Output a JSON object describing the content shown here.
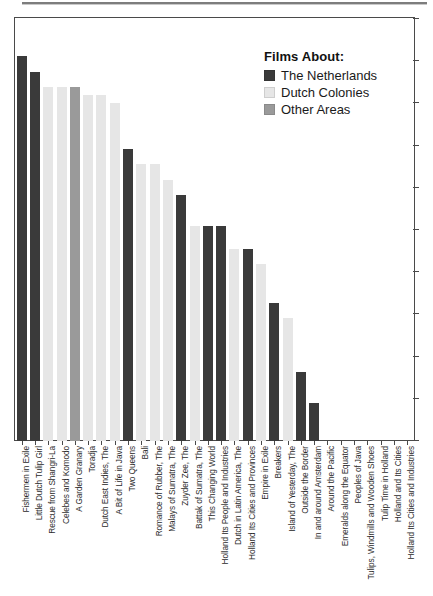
{
  "chart_data": {
    "type": "bar",
    "title": "",
    "subtitle": "",
    "xlabel": "",
    "ylabel": "",
    "grid": false,
    "legend_position": "top-right",
    "legend_title": "Films About:",
    "axis": {
      "y_tick_count": 11,
      "y_tick_labels": [],
      "x_tick_count": 27,
      "ylim": [
        0,
        11
      ]
    },
    "groups": [
      {
        "name": "The Netherlands",
        "color": "#3a3a3a"
      },
      {
        "name": "Dutch Colonies",
        "color": "#e6e6e6"
      },
      {
        "name": "Other Areas",
        "color": "#9a9a9a"
      }
    ],
    "categories": [
      "Fishermen in Exile",
      "Little Dutch Tulip Girl",
      "Rescue from Shangri-La",
      "Celebes and Komodo",
      "A Garden Granary",
      "Toradja",
      "Dutch East Indies, The",
      "A Bit of Life in Java",
      "Two Queens",
      "Bali",
      "Romance of Rubber, The",
      "Malays of Sumatra, The",
      "Zuyder Zee, The",
      "Battak of Sumatra, The",
      "This Changing World",
      "Holland  Its People and Industries",
      "Dutch in Latin America, The",
      "Holland  Its Cities and Provinces",
      "Empire in Exile",
      "Breakers",
      "Island of Yesterday, The",
      "Outside the Border",
      "In and around Amsterdam",
      "Around the Pacific",
      "Emeralds along the Equator",
      "Peoples of Java",
      "Tulips, Windmills and Wooden Shoes",
      "Tulip Time in Holland",
      "Holland and Its Cities",
      "Holland  Its Cities and Industries"
    ],
    "values": [
      10.0,
      9.6,
      9.2,
      9.2,
      9.2,
      9.0,
      9.0,
      8.8,
      7.6,
      7.2,
      7.2,
      6.8,
      6.4,
      5.6,
      5.6,
      5.6,
      5.0,
      5.0,
      4.6,
      3.6,
      3.2,
      1.8,
      1.0,
      0.0,
      0.0,
      0.0,
      0.0,
      0.0,
      0.0,
      0.0
    ],
    "series_groups": [
      "The Netherlands",
      "The Netherlands",
      "Dutch Colonies",
      "Dutch Colonies",
      "Other Areas",
      "Dutch Colonies",
      "Dutch Colonies",
      "Dutch Colonies",
      "The Netherlands",
      "Dutch Colonies",
      "Dutch Colonies",
      "Dutch Colonies",
      "The Netherlands",
      "Dutch Colonies",
      "The Netherlands",
      "The Netherlands",
      "Dutch Colonies",
      "The Netherlands",
      "Dutch Colonies",
      "The Netherlands",
      "Dutch Colonies",
      "The Netherlands",
      "The Netherlands",
      "Dutch Colonies",
      "Dutch Colonies",
      "Dutch Colonies",
      "The Netherlands",
      "The Netherlands",
      "The Netherlands",
      "The Netherlands"
    ]
  },
  "legend": {
    "title": "Films About:",
    "items": [
      {
        "label": "The Netherlands",
        "color": "#3a3a3a"
      },
      {
        "label": "Dutch Colonies",
        "color": "#e6e6e6"
      },
      {
        "label": "Other Areas",
        "color": "#9a9a9a"
      }
    ]
  }
}
